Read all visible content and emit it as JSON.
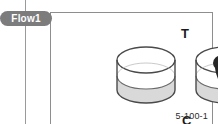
{
  "figure": {
    "flow_tab_label": "Flow1",
    "marker_top": "T",
    "marker_bottom": "C",
    "figure_id": "5-100-1"
  },
  "colors": {
    "tab_background": "#7c7c7c",
    "tab_text": "#ffffff",
    "frame_border": "#8e8e8e",
    "page_rule": "#9a9a9a",
    "ink": "#1a1a1a",
    "liquid_fill": "#d9d9d9",
    "blob_fill": "#262626",
    "vessel_outline": "#4a4a4a"
  },
  "illustrations": {
    "left_vessel": {
      "name": "open-cylinder-quiescent",
      "description": "open cylindrical vessel with flat still liquid surface"
    },
    "right_vessel": {
      "name": "open-cylinder-vortex",
      "description": "open cylindrical vessel with dark mushroom shaped plume rising from liquid surface"
    }
  }
}
